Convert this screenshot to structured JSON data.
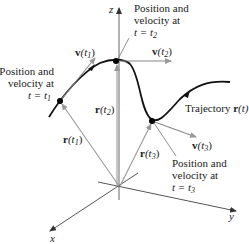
{
  "diagram": {
    "type": "3d-space-curve",
    "colors": {
      "curve": "#111111",
      "axes": "#555555",
      "position_vectors": "#999999",
      "velocity_vectors": "#888888",
      "points": "#000000",
      "text": "#222222"
    },
    "axes": {
      "x": "x",
      "y": "y",
      "z": "z"
    },
    "curve_label": {
      "prefix": "Trajectory ",
      "func": "r",
      "arg": "(t)"
    },
    "points": [
      {
        "id": "t1",
        "position_label": {
          "func": "r",
          "open": "(t",
          "sub": "1",
          "close": ")"
        },
        "velocity_label": {
          "func": "v",
          "open": "(t",
          "sub": "1",
          "close": ")"
        },
        "caption": [
          "Position and",
          "velocity at",
          "t = t"
        ],
        "caption_sub": "1"
      },
      {
        "id": "t2",
        "position_label": {
          "func": "r",
          "open": "(t",
          "sub": "2",
          "close": ")"
        },
        "velocity_label": {
          "func": "v",
          "open": "(t",
          "sub": "2",
          "close": ")"
        },
        "caption": [
          "Position and",
          "velocity at",
          "t = t"
        ],
        "caption_sub": "2"
      },
      {
        "id": "t3",
        "position_label": {
          "func": "r",
          "open": "(t",
          "sub": "3",
          "close": ")"
        },
        "velocity_label": {
          "func": "v",
          "open": "(t",
          "sub": "3",
          "close": ")"
        },
        "caption": [
          "Position and",
          "velocity at",
          "t = t"
        ],
        "caption_sub": "3"
      }
    ]
  }
}
